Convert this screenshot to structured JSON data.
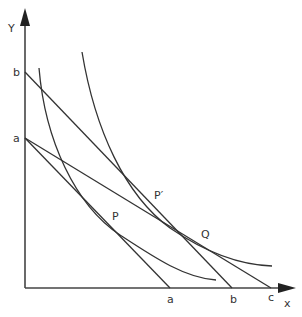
{
  "diagram": {
    "type": "indifference-curve-budget-line",
    "axes": {
      "x_label": "x",
      "y_label": "Y"
    },
    "y_intercepts": [
      "b",
      "a"
    ],
    "x_intercepts": [
      "a",
      "b",
      "c"
    ],
    "points": [
      "P",
      "P′",
      "Q"
    ],
    "budget_lines": [
      {
        "from": "a (Y)",
        "to": "a (x)"
      },
      {
        "from": "b (Y)",
        "to": "b (x)"
      },
      {
        "from": "a (Y)",
        "to": "c (x)"
      }
    ],
    "indifference_curves": 2,
    "colors": {
      "line": "#333333",
      "background": "#ffffff"
    }
  }
}
